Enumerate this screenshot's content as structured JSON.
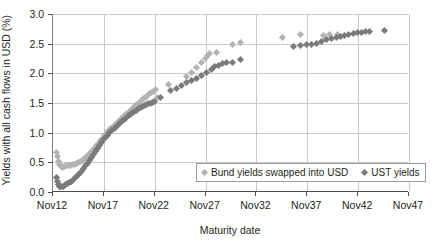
{
  "chart_data": {
    "type": "scatter",
    "title": "",
    "xlabel": "Maturity date",
    "ylabel": "Yields with all cash flows in USD (%)",
    "xlim": [
      2012,
      2047
    ],
    "ylim": [
      0.0,
      3.0
    ],
    "grid": true,
    "legend_position": "inside-bottom-right",
    "xticks": [
      "Nov12",
      "Nov17",
      "Nov22",
      "Nov27",
      "Nov32",
      "Nov37",
      "Nov42",
      "Nov47"
    ],
    "xtick_values": [
      2012,
      2017,
      2022,
      2027,
      2032,
      2037,
      2042,
      2047
    ],
    "yticks": [
      "0.0",
      "0.5",
      "1.0",
      "1.5",
      "2.0",
      "2.5",
      "3.0"
    ],
    "ytick_values": [
      0.0,
      0.5,
      1.0,
      1.5,
      2.0,
      2.5,
      3.0
    ],
    "colors": {
      "series0": "#b3b3b3",
      "series1": "#7a7a7a",
      "grid": "#c9c9c9",
      "axis": "#4d4d4d"
    },
    "marker": "diamond",
    "series": [
      {
        "name": "Bund yields swapped into USD",
        "color": "#b3b3b3",
        "points": [
          [
            2012.35,
            0.67
          ],
          [
            2012.45,
            0.6
          ],
          [
            2012.55,
            0.52
          ],
          [
            2012.62,
            0.47
          ],
          [
            2012.7,
            0.44
          ],
          [
            2012.8,
            0.43
          ],
          [
            2012.95,
            0.42
          ],
          [
            2013.1,
            0.43
          ],
          [
            2013.3,
            0.44
          ],
          [
            2013.5,
            0.45
          ],
          [
            2013.7,
            0.45
          ],
          [
            2013.9,
            0.46
          ],
          [
            2014.1,
            0.47
          ],
          [
            2014.3,
            0.48
          ],
          [
            2014.5,
            0.49
          ],
          [
            2014.7,
            0.51
          ],
          [
            2014.9,
            0.53
          ],
          [
            2015.1,
            0.56
          ],
          [
            2015.3,
            0.59
          ],
          [
            2015.5,
            0.62
          ],
          [
            2015.7,
            0.66
          ],
          [
            2015.9,
            0.7
          ],
          [
            2016.1,
            0.74
          ],
          [
            2016.3,
            0.78
          ],
          [
            2016.5,
            0.82
          ],
          [
            2016.7,
            0.86
          ],
          [
            2016.9,
            0.9
          ],
          [
            2017.1,
            0.95
          ],
          [
            2017.3,
            0.99
          ],
          [
            2017.5,
            1.03
          ],
          [
            2017.7,
            1.07
          ],
          [
            2017.9,
            1.1
          ],
          [
            2018.1,
            1.14
          ],
          [
            2018.3,
            1.17
          ],
          [
            2018.5,
            1.21
          ],
          [
            2018.7,
            1.24
          ],
          [
            2018.9,
            1.27
          ],
          [
            2019.1,
            1.3
          ],
          [
            2019.3,
            1.33
          ],
          [
            2019.5,
            1.36
          ],
          [
            2019.7,
            1.39
          ],
          [
            2019.9,
            1.42
          ],
          [
            2020.1,
            1.45
          ],
          [
            2020.3,
            1.48
          ],
          [
            2020.5,
            1.51
          ],
          [
            2020.7,
            1.54
          ],
          [
            2020.9,
            1.57
          ],
          [
            2021.1,
            1.6
          ],
          [
            2021.3,
            1.63
          ],
          [
            2021.5,
            1.66
          ],
          [
            2021.7,
            1.68
          ],
          [
            2021.9,
            1.7
          ],
          [
            2022.05,
            1.72
          ],
          [
            2022.3,
            1.6
          ],
          [
            2023.4,
            1.82
          ],
          [
            2025.1,
            1.95
          ],
          [
            2025.6,
            2.02
          ],
          [
            2026.1,
            2.1
          ],
          [
            2026.6,
            2.18
          ],
          [
            2026.95,
            2.25
          ],
          [
            2027.2,
            2.3
          ],
          [
            2027.4,
            2.33
          ],
          [
            2028.05,
            2.35
          ],
          [
            2029.6,
            2.49
          ],
          [
            2030.45,
            2.52
          ],
          [
            2034.6,
            2.6
          ],
          [
            2036.3,
            2.66
          ],
          [
            2038.6,
            2.63
          ],
          [
            2039.2,
            2.66
          ],
          [
            2039.95,
            2.65
          ]
        ]
      },
      {
        "name": "UST yields",
        "color": "#7a7a7a",
        "points": [
          [
            2012.3,
            0.25
          ],
          [
            2012.4,
            0.18
          ],
          [
            2012.5,
            0.13
          ],
          [
            2012.6,
            0.1
          ],
          [
            2012.7,
            0.09
          ],
          [
            2012.85,
            0.09
          ],
          [
            2013.0,
            0.1
          ],
          [
            2013.2,
            0.12
          ],
          [
            2013.4,
            0.14
          ],
          [
            2013.6,
            0.16
          ],
          [
            2013.8,
            0.18
          ],
          [
            2014.0,
            0.21
          ],
          [
            2014.2,
            0.24
          ],
          [
            2014.4,
            0.27
          ],
          [
            2014.6,
            0.31
          ],
          [
            2014.8,
            0.35
          ],
          [
            2015.0,
            0.39
          ],
          [
            2015.2,
            0.44
          ],
          [
            2015.4,
            0.48
          ],
          [
            2015.6,
            0.53
          ],
          [
            2015.8,
            0.58
          ],
          [
            2016.0,
            0.63
          ],
          [
            2016.2,
            0.68
          ],
          [
            2016.4,
            0.73
          ],
          [
            2016.6,
            0.78
          ],
          [
            2016.8,
            0.83
          ],
          [
            2017.0,
            0.88
          ],
          [
            2017.2,
            0.92
          ],
          [
            2017.4,
            0.96
          ],
          [
            2017.6,
            1.0
          ],
          [
            2017.8,
            1.04
          ],
          [
            2018.0,
            1.07
          ],
          [
            2018.2,
            1.11
          ],
          [
            2018.4,
            1.14
          ],
          [
            2018.6,
            1.17
          ],
          [
            2018.8,
            1.2
          ],
          [
            2019.0,
            1.23
          ],
          [
            2019.2,
            1.26
          ],
          [
            2019.4,
            1.29
          ],
          [
            2019.6,
            1.31
          ],
          [
            2019.8,
            1.34
          ],
          [
            2020.0,
            1.36
          ],
          [
            2020.2,
            1.38
          ],
          [
            2020.4,
            1.4
          ],
          [
            2020.6,
            1.42
          ],
          [
            2020.8,
            1.44
          ],
          [
            2021.0,
            1.46
          ],
          [
            2021.2,
            1.47
          ],
          [
            2021.4,
            1.49
          ],
          [
            2021.6,
            1.5
          ],
          [
            2021.8,
            1.51
          ],
          [
            2022.0,
            1.52
          ],
          [
            2022.6,
            1.59
          ],
          [
            2023.6,
            1.71
          ],
          [
            2024.1,
            1.75
          ],
          [
            2024.6,
            1.8
          ],
          [
            2025.1,
            1.84
          ],
          [
            2025.6,
            1.88
          ],
          [
            2026.1,
            1.92
          ],
          [
            2026.6,
            1.97
          ],
          [
            2027.1,
            2.02
          ],
          [
            2027.6,
            2.06
          ],
          [
            2027.9,
            2.12
          ],
          [
            2028.3,
            2.14
          ],
          [
            2028.7,
            2.16
          ],
          [
            2029.1,
            2.18
          ],
          [
            2029.6,
            2.19
          ],
          [
            2030.4,
            2.24
          ],
          [
            2035.6,
            2.46
          ],
          [
            2036.3,
            2.47
          ],
          [
            2036.9,
            2.49
          ],
          [
            2037.4,
            2.49
          ],
          [
            2037.9,
            2.51
          ],
          [
            2038.4,
            2.54
          ],
          [
            2038.9,
            2.57
          ],
          [
            2039.4,
            2.58
          ],
          [
            2039.9,
            2.6
          ],
          [
            2040.3,
            2.62
          ],
          [
            2040.7,
            2.64
          ],
          [
            2041.1,
            2.66
          ],
          [
            2041.5,
            2.67
          ],
          [
            2041.9,
            2.68
          ],
          [
            2042.3,
            2.69
          ],
          [
            2042.7,
            2.7
          ],
          [
            2043.1,
            2.71
          ],
          [
            2044.6,
            2.72
          ]
        ]
      }
    ]
  },
  "legend": {
    "items": [
      {
        "label": "Bund yields swapped into USD"
      },
      {
        "label": "UST yields"
      }
    ]
  }
}
